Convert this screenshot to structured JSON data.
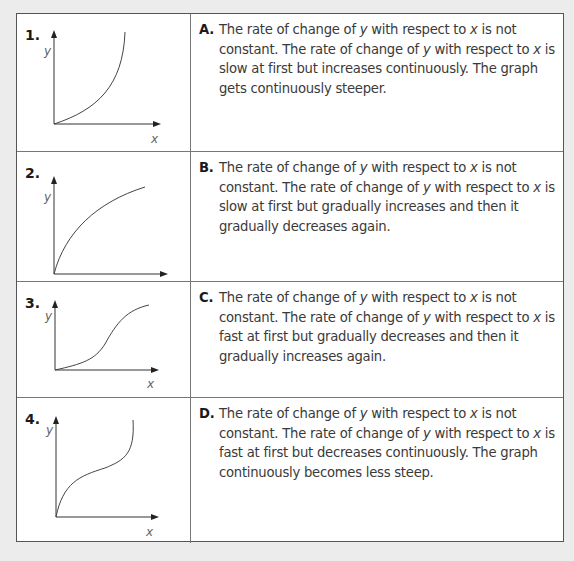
{
  "rows": [
    {
      "number": "1.",
      "graph": {
        "y_label": "y",
        "x_label": "x",
        "shape": "concave-up increasing (gets steeper)"
      },
      "letter": "A.",
      "text": {
        "s1a": "The rate of change of ",
        "v1": "y",
        "s1b": " with respect to ",
        "v2": "x",
        "s1c": " is not constant.",
        "s2a": " The rate of change of ",
        "v3": "y",
        "s2b": " with respect to ",
        "v4": "x",
        "s2c": " is slow at first but increases continuously. The graph gets continuously steeper."
      }
    },
    {
      "number": "2.",
      "graph": {
        "y_label": "y",
        "x_label": "x",
        "shape": "concave-down increasing (less steep)"
      },
      "letter": "B.",
      "text": {
        "s1a": "The rate of change of ",
        "v1": "y",
        "s1b": " with respect to ",
        "v2": "x",
        "s1c": " is not constant.",
        "s2a": " The rate of change of ",
        "v3": "y",
        "s2b": " with respect to ",
        "v4": "x",
        "s2c": " is slow at first but gradually increases and then it gradually decreases again."
      }
    },
    {
      "number": "3.",
      "graph": {
        "y_label": "y",
        "x_label": "x",
        "shape": "S-curve (slow, fast, slow)"
      },
      "letter": "C.",
      "text": {
        "s1a": "The rate of change of ",
        "v1": "y",
        "s1b": " with respect to ",
        "v2": "x",
        "s1c": " is not constant.",
        "s2a": " The rate of change of ",
        "v3": "y",
        "s2b": " with respect to ",
        "v4": "x",
        "s2c": " is fast at first but gradually decreases and then it gradually increases again."
      }
    },
    {
      "number": "4.",
      "graph": {
        "y_label": "y",
        "x_label": "x",
        "shape": "inverse S-curve (fast, slow, fast)"
      },
      "letter": "D.",
      "text": {
        "s1a": "The rate of change of ",
        "v1": "y",
        "s1b": " with respect to ",
        "v2": "x",
        "s1c": " is not constant.",
        "s2a": " The rate of change of ",
        "v3": "y",
        "s2b": " with respect to ",
        "v4": "x",
        "s2c": " is fast at first but decreases continuously. The graph continuously becomes less steep."
      }
    }
  ]
}
